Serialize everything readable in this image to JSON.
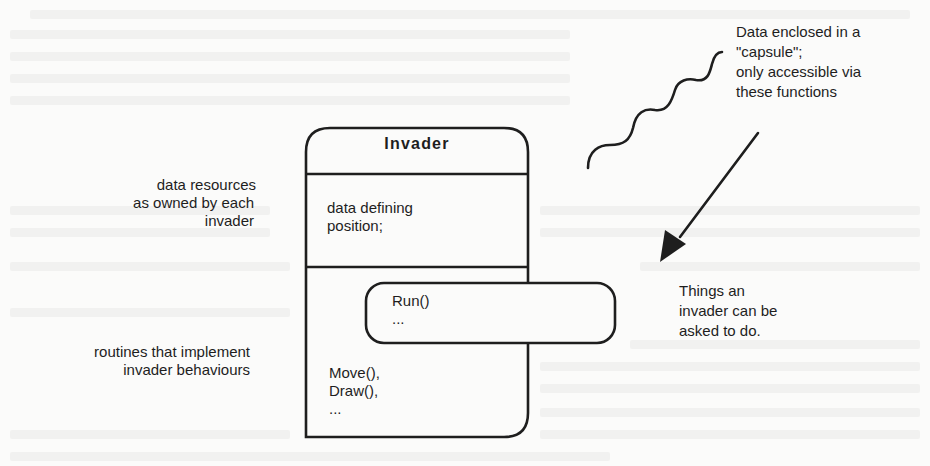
{
  "diagram": {
    "box": {
      "title": "Invader",
      "data_section": [
        "data defining",
        "position;"
      ],
      "routines_section": [
        "Move(),",
        "Draw(),",
        "..."
      ]
    },
    "capsule": {
      "lines": [
        "Run()",
        "..."
      ]
    },
    "labels": {
      "data_resources": [
        "data resources",
        "as owned by each",
        "invader"
      ],
      "routines": [
        "routines that implement",
        "invader behaviours"
      ],
      "capsule_note": [
        "Data enclosed in a",
        "\"capsule\";",
        "only accessible via",
        "these  functions"
      ],
      "things": [
        "Things an",
        "invader can be",
        "asked to do."
      ]
    },
    "colors": {
      "ink": "#1e1e1e",
      "paper": "#fbfbfa"
    }
  }
}
